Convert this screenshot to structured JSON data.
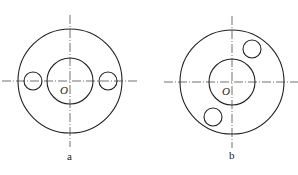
{
  "figures": [
    {
      "id": "a",
      "label": "a",
      "center_label": "O",
      "center": [
        70,
        81
      ],
      "outer_r": 52,
      "inner_r": 23,
      "holes": [
        {
          "cx": 33,
          "cy": 81,
          "r": 9
        },
        {
          "cx": 108,
          "cy": 81,
          "r": 9
        }
      ]
    },
    {
      "id": "b",
      "label": "b",
      "center_label": "O",
      "center": [
        232,
        82
      ],
      "outer_r": 52,
      "inner_r": 23,
      "holes": [
        {
          "cx": 252,
          "cy": 49,
          "r": 9
        },
        {
          "cx": 213,
          "cy": 117,
          "r": 9
        }
      ]
    }
  ],
  "colors": {
    "stroke": "#222222",
    "centerline": "#333333",
    "background": "#ffffff"
  }
}
